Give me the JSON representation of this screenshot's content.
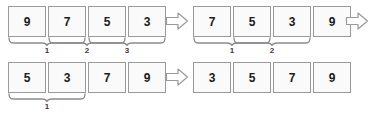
{
  "diagram": {
    "colors": {
      "box_border": "#9a9a9a",
      "box_fill": "#fafafa",
      "text": "#1b1b1b",
      "brace": "#8c8c8c",
      "arrow_border": "#9a9a9a",
      "background": "#ffffff"
    },
    "rows": [
      {
        "name": "row-1",
        "groups": [
          {
            "name": "group-before-pass-1",
            "values": [
              "9",
              "7",
              "5",
              "3"
            ],
            "braces": [
              {
                "label": "1",
                "span_start": 0,
                "span_end": 1
              },
              {
                "label": "2",
                "span_start": 1,
                "span_end": 2
              },
              {
                "label": "3",
                "span_start": 2,
                "span_end": 3
              }
            ]
          },
          {
            "name": "group-after-pass-1",
            "values": [
              "7",
              "5",
              "3",
              "9"
            ],
            "braces": [
              {
                "label": "1",
                "span_start": 0,
                "span_end": 1
              },
              {
                "label": "2",
                "span_start": 1,
                "span_end": 2
              }
            ]
          }
        ],
        "arrows": [
          "arrow-right-middle",
          "arrow-right-trailing"
        ]
      },
      {
        "name": "row-2",
        "groups": [
          {
            "name": "group-before-pass-3",
            "values": [
              "5",
              "3",
              "7",
              "9"
            ],
            "braces": [
              {
                "label": "1",
                "span_start": 0,
                "span_end": 1
              }
            ]
          },
          {
            "name": "group-sorted-final",
            "values": [
              "3",
              "5",
              "7",
              "9"
            ],
            "braces": []
          }
        ],
        "arrows": [
          "arrow-right-middle"
        ]
      }
    ]
  }
}
